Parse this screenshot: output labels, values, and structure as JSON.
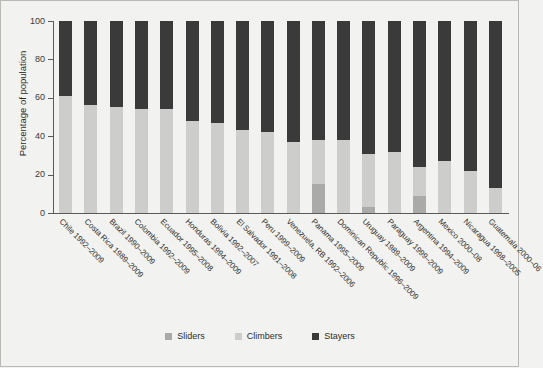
{
  "chart_data": {
    "type": "bar",
    "stacked": true,
    "title": "",
    "xlabel": "",
    "ylabel": "Percentage of population",
    "ylim": [
      0,
      100
    ],
    "yticks": [
      0,
      20,
      40,
      60,
      80,
      100
    ],
    "grid": false,
    "legend_position": "bottom",
    "legend": [
      "Sliders",
      "Climbers",
      "Stayers"
    ],
    "colors": {
      "sliders": "#aaaaa8",
      "climbers": "#cdcdcb",
      "stayers": "#3a3a3a",
      "background": "#f2f2f0",
      "axis": "#5a5a58"
    },
    "categories": [
      "Chile 1992–2009",
      "Costa Rica 1989–2009",
      "Brazil 1990–2009",
      "Colombia 1992–2009",
      "Ecuador 1995–2008",
      "Honduras 1994–2009",
      "Bolivia 1992–2007",
      "El Salvador 1991–2008",
      "Peru 1999–2009",
      "Venezuela, RB 1992–2006",
      "Panama 1995–2009",
      "Dominican Republic 1996–2009",
      "Uruguay 1989–2009",
      "Paraguay 1999–2009",
      "Argentina 1994–2009",
      "Mexico 2000–08",
      "Nicaragua 1998–2005",
      "Guatemala 2000–06"
    ],
    "series": [
      {
        "name": "Sliders",
        "key": "sliders",
        "color": "#aaaaa8",
        "values": [
          0,
          0,
          0,
          0,
          0,
          0,
          0,
          0,
          0,
          0,
          15,
          0,
          3,
          0,
          9,
          0,
          0,
          0
        ]
      },
      {
        "name": "Climbers",
        "key": "climbers",
        "color": "#cdcdcb",
        "values": [
          61,
          56,
          55,
          54,
          54,
          48,
          47,
          43,
          42,
          37,
          23,
          38,
          28,
          32,
          15,
          27,
          22,
          13
        ]
      },
      {
        "name": "Stayers",
        "key": "stayers",
        "color": "#3a3a3a",
        "values": [
          39,
          44,
          45,
          46,
          46,
          52,
          53,
          57,
          58,
          63,
          62,
          62,
          69,
          68,
          76,
          73,
          78,
          87
        ]
      }
    ]
  }
}
